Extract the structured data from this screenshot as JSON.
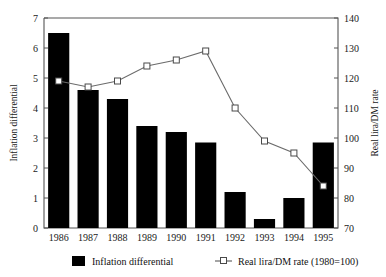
{
  "top_cut_text": "",
  "chart_data": {
    "type": "bar",
    "title": "",
    "xlabel": "",
    "categories": [
      "1986",
      "1987",
      "1988",
      "1989",
      "1990",
      "1991",
      "1992",
      "1993",
      "1994",
      "1995"
    ],
    "grid": false,
    "legend_position": "bottom",
    "axes": {
      "left": {
        "label": "Inflation differential",
        "min": 0,
        "max": 7,
        "step": 1,
        "ticks": [
          "0",
          "1",
          "2",
          "3",
          "4",
          "5",
          "6",
          "7"
        ]
      },
      "right": {
        "label": "Real lira/DM rate",
        "min": 70,
        "max": 140,
        "step": 10,
        "ticks": [
          "70",
          "80",
          "90",
          "100",
          "110",
          "120",
          "130",
          "140"
        ]
      }
    },
    "series": [
      {
        "name": "Inflation differential",
        "kind": "bar",
        "axis": "left",
        "color": "#000000",
        "values": [
          6.5,
          4.6,
          4.3,
          3.4,
          3.2,
          2.85,
          1.2,
          0.3,
          1.0,
          2.85
        ]
      },
      {
        "name": "Real lira/DM rate (1980=100)",
        "kind": "line",
        "axis": "right",
        "color": "#6b6b6b",
        "marker": "open-square",
        "values": [
          119,
          117,
          119,
          124,
          126,
          129,
          110,
          99,
          95,
          84
        ]
      }
    ]
  },
  "legend": {
    "items": [
      {
        "label": "Inflation differential",
        "marker": "filled-square",
        "color": "#000000"
      },
      {
        "label": "Real lira/DM rate (1980=100)",
        "marker": "line-open-square",
        "color": "#5a5a5a"
      }
    ]
  }
}
